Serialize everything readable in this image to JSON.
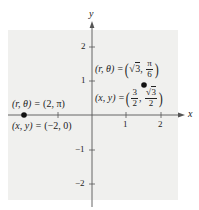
{
  "diagram": {
    "type": "polar-to-rectangular-coordinate-plot",
    "background_color": "#f0f0ee",
    "axis_color": "#555555",
    "axes": {
      "x_label": "x",
      "y_label": "y",
      "x_ticks": [
        {
          "value": -2,
          "label": ""
        },
        {
          "value": -1,
          "label": ""
        },
        {
          "value": 1,
          "label": "1"
        },
        {
          "value": 2,
          "label": "2"
        }
      ],
      "y_ticks": [
        {
          "value": 2,
          "label": "2"
        },
        {
          "value": 1,
          "label": "1"
        },
        {
          "value": -1,
          "label": "−1"
        },
        {
          "value": -2,
          "label": "−2"
        }
      ]
    },
    "points": [
      {
        "x": -2,
        "y": 0,
        "polar_label": {
          "lhs": "(r, θ) = ",
          "rhs": "(2, π)"
        },
        "rect_label": {
          "lhs": "(x, y) = ",
          "rhs": "(−2, 0)"
        }
      },
      {
        "x": 1.5,
        "y": 0.866,
        "polar_label": {
          "lhs": "(r, θ) = ",
          "sqrt_arg": "3",
          "frac_num": "π",
          "frac_den": "6"
        },
        "rect_label": {
          "lhs": "(x, y) = ",
          "frac1_num": "3",
          "frac1_den": "2",
          "frac2_sqrt_arg": "3",
          "frac2_den": "2"
        }
      }
    ]
  }
}
